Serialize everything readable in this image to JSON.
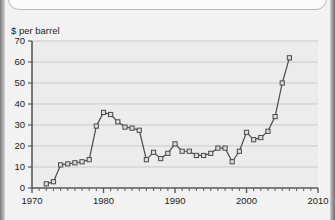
{
  "page": {
    "background_color": "#f2f2f2",
    "faint_header_text": "",
    "edge_artifact_color": "#8a8a8a"
  },
  "chart_data": {
    "type": "line",
    "title": "",
    "subtitle": "",
    "xlabel": "",
    "ylabel": "$ per barrel",
    "axis_unit_label": "$ per barrel",
    "xlim": [
      1970,
      2010
    ],
    "ylim": [
      0,
      70
    ],
    "xticks": [
      1970,
      1980,
      1990,
      2000,
      2010
    ],
    "xtick_labels": [
      "1970",
      "1980",
      "1990",
      "2000",
      "2010"
    ],
    "minor_xtick_interval": 1,
    "yticks": [
      0,
      10,
      20,
      30,
      40,
      50,
      60,
      70
    ],
    "ytick_labels": [
      "0",
      "10",
      "20",
      "30",
      "40",
      "50",
      "60",
      "70"
    ],
    "grid": "horizontal",
    "legend": "none",
    "marker": "open-square",
    "line_color": "#4a4a4a",
    "marker_edge_color": "#4a4a4a",
    "marker_face_color": "#dcdcdc",
    "plot_background_color": "#ececec",
    "gridline_color": "#c9c9c9",
    "axis_color": "#5a5a5a",
    "x": [
      1972,
      1973,
      1974,
      1975,
      1976,
      1977,
      1978,
      1979,
      1980,
      1981,
      1982,
      1983,
      1984,
      1985,
      1986,
      1987,
      1988,
      1989,
      1990,
      1991,
      1992,
      1993,
      1994,
      1995,
      1996,
      1997,
      1998,
      1999,
      2000,
      2001,
      2002,
      2003,
      2004,
      2005,
      2006
    ],
    "values": [
      2.0,
      3.0,
      11.0,
      11.5,
      12.0,
      12.5,
      13.5,
      29.5,
      36.0,
      35.0,
      31.5,
      29.0,
      28.5,
      27.5,
      13.5,
      17.0,
      14.0,
      16.5,
      21.0,
      17.5,
      17.5,
      15.5,
      15.5,
      16.5,
      19.0,
      19.0,
      12.5,
      17.5,
      26.5,
      23.0,
      24.0,
      27.0,
      34.0,
      50.0,
      62.0
    ]
  }
}
